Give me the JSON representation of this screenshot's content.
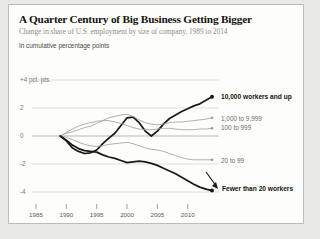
{
  "card": {
    "title": "A Quarter Century of Big Business Getting Bigger",
    "subtitle": "Change in share of U.S. employment by size of company, 1989 to 2014",
    "unit_note": "In cumulative percentage points"
  },
  "colors": {
    "background": "#e9e9e7",
    "card": "#fdfdfb",
    "card_border": "#bdbdb8",
    "grid": "#d8d7d2",
    "zero_line": "#b9b8b2",
    "line_default": "#a3a29b",
    "line_highlight": "#1a1a17",
    "title_text": "#15140f",
    "subtitle_text": "#8e8d86",
    "axis_text": "#77766f"
  },
  "chart_data": {
    "type": "line",
    "title": "A Quarter Century of Big Business Getting Bigger",
    "subtitle": "Change in share of U.S. employment by size of company, 1989 to 2014",
    "xlabel": "",
    "ylabel": "In cumulative percentage points",
    "xlim": [
      1983.5,
      2014.5
    ],
    "ylim": [
      -5.2,
      4.6
    ],
    "grid": true,
    "legend": "inline-right-labels",
    "x_ticks": [
      "1985",
      "1990",
      "1995",
      "2000",
      "2005",
      "2010"
    ],
    "x_tick_values": [
      1985,
      1990,
      1995,
      2000,
      2005,
      2010
    ],
    "y_ticks": [
      "+4 pct. pts.",
      "2",
      "0",
      "-2",
      "-4"
    ],
    "y_tick_values": [
      4,
      2,
      0,
      -2,
      -4
    ],
    "x": [
      1989,
      1990,
      1991,
      1992,
      1993,
      1994,
      1995,
      1996,
      1997,
      1998,
      1999,
      2000,
      2001,
      2002,
      2003,
      2004,
      2005,
      2006,
      2007,
      2008,
      2009,
      2010,
      2011,
      2012,
      2013,
      2014
    ],
    "series": [
      {
        "name": "10,000 workers and up",
        "label": "10,000 workers and up",
        "highlight": true,
        "color": "#1a1a17",
        "end_value": 2.8,
        "values": [
          0.0,
          -0.35,
          -0.85,
          -1.1,
          -1.25,
          -1.2,
          -1.0,
          -0.55,
          -0.15,
          0.2,
          0.75,
          1.3,
          1.35,
          0.95,
          0.35,
          0.0,
          0.35,
          0.85,
          1.25,
          1.5,
          1.75,
          1.95,
          2.15,
          2.3,
          2.55,
          2.8
        ]
      },
      {
        "name": "1,000 to 9,999",
        "label": "1,000 to 9,999",
        "highlight": false,
        "color": "#a3a29b",
        "end_value": 1.3,
        "values": [
          0.0,
          0.2,
          0.3,
          0.45,
          0.6,
          0.7,
          0.9,
          1.1,
          1.3,
          1.4,
          1.5,
          1.55,
          1.4,
          1.15,
          0.95,
          0.85,
          0.8,
          0.85,
          0.95,
          1.0,
          1.0,
          1.05,
          1.1,
          1.15,
          1.2,
          1.3
        ]
      },
      {
        "name": "100 to 999",
        "label": "100 to 999",
        "highlight": false,
        "color": "#a3a29b",
        "end_value": 0.55,
        "values": [
          0.0,
          0.25,
          0.5,
          0.7,
          0.85,
          0.95,
          1.05,
          1.1,
          1.1,
          1.0,
          0.9,
          0.75,
          0.6,
          0.5,
          0.45,
          0.45,
          0.5,
          0.55,
          0.55,
          0.5,
          0.45,
          0.45,
          0.45,
          0.5,
          0.5,
          0.55
        ]
      },
      {
        "name": "20 to 99",
        "label": "20 to 99",
        "highlight": false,
        "color": "#a3a29b",
        "end_value": -1.7,
        "values": [
          0.0,
          -0.1,
          -0.25,
          -0.45,
          -0.6,
          -0.7,
          -0.75,
          -0.7,
          -0.6,
          -0.55,
          -0.5,
          -0.45,
          -0.55,
          -0.7,
          -0.85,
          -0.95,
          -1.0,
          -1.1,
          -1.25,
          -1.4,
          -1.55,
          -1.65,
          -1.7,
          -1.7,
          -1.7,
          -1.7
        ]
      },
      {
        "name": "Fewer than 20 workers",
        "label": "Fewer than 20 workers",
        "highlight": true,
        "color": "#1a1a17",
        "end_value": -3.9,
        "values": [
          0.0,
          -0.3,
          -0.65,
          -0.9,
          -1.05,
          -1.1,
          -1.15,
          -1.35,
          -1.5,
          -1.6,
          -1.75,
          -1.9,
          -1.85,
          -1.8,
          -1.85,
          -1.95,
          -2.1,
          -2.3,
          -2.5,
          -2.7,
          -2.95,
          -3.2,
          -3.45,
          -3.65,
          -3.8,
          -3.9
        ]
      }
    ]
  }
}
